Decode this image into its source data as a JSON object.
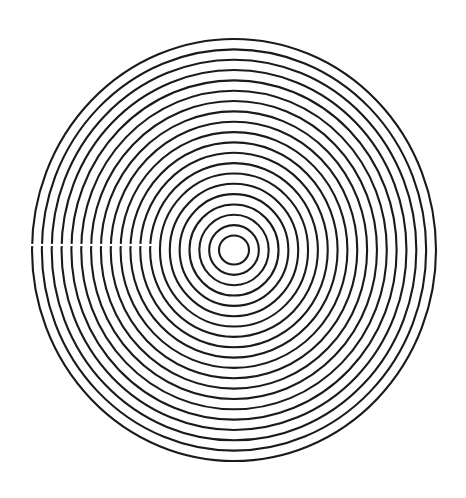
{
  "figure": {
    "background": "#ffffff",
    "stroke_color": "#1a1a1a",
    "stroke_width": 2.1,
    "center": {
      "x": 234,
      "y": 250
    },
    "ring_count": 20,
    "inner_radius": {
      "rx": 15,
      "ry": 14.5
    },
    "outer_radius": {
      "rx": 202,
      "ry": 211
    },
    "gap": {
      "y": 245,
      "x_start": 26,
      "x_end": 152,
      "height": 2.2,
      "color": "#ffffff"
    }
  }
}
